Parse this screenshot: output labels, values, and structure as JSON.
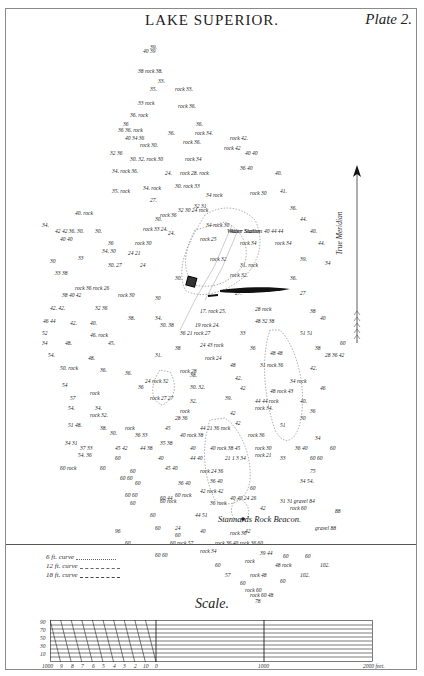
{
  "header": {
    "title": "LAKE SUPERIOR.",
    "plate": "Plate 2."
  },
  "compass": {
    "label": "True Meridian"
  },
  "map_labels": {
    "water_station": "Water Station",
    "beacon": "Stannards Rock Beacon.",
    "gravel_1": "gravel",
    "gravel_2": "gravel"
  },
  "soundings": [
    {
      "x": 150,
      "y": 44,
      "t": "39."
    },
    {
      "x": 143,
      "y": 48,
      "t": "40 39"
    },
    {
      "x": 138,
      "y": 68,
      "t": "38 rock 38."
    },
    {
      "x": 158,
      "y": 78,
      "t": "33."
    },
    {
      "x": 150,
      "y": 86,
      "t": "35."
    },
    {
      "x": 175,
      "y": 86,
      "t": "rock 33."
    },
    {
      "x": 138,
      "y": 100,
      "t": "33 rock"
    },
    {
      "x": 178,
      "y": 103,
      "t": "rock 36."
    },
    {
      "x": 130,
      "y": 112,
      "t": "36. rock"
    },
    {
      "x": 196,
      "y": 121,
      "t": "36."
    },
    {
      "x": 123,
      "y": 121,
      "t": "36"
    },
    {
      "x": 118,
      "y": 127,
      "t": "36 36. rock"
    },
    {
      "x": 168,
      "y": 130,
      "t": "36."
    },
    {
      "x": 195,
      "y": 130,
      "t": "rock 34."
    },
    {
      "x": 125,
      "y": 135,
      "t": "40 34 36"
    },
    {
      "x": 140,
      "y": 142,
      "t": "rock 30."
    },
    {
      "x": 183,
      "y": 139,
      "t": "rock 36."
    },
    {
      "x": 230,
      "y": 135,
      "t": "rock 42."
    },
    {
      "x": 224,
      "y": 145,
      "t": "rock 42"
    },
    {
      "x": 110,
      "y": 150,
      "t": "32 36"
    },
    {
      "x": 130,
      "y": 156,
      "t": "30. 32. rock 30"
    },
    {
      "x": 185,
      "y": 156,
      "t": "rock 34"
    },
    {
      "x": 245,
      "y": 150,
      "t": "40 40"
    },
    {
      "x": 112,
      "y": 168,
      "t": "34. rock 36."
    },
    {
      "x": 165,
      "y": 170,
      "t": "24."
    },
    {
      "x": 180,
      "y": 170,
      "t": "rock 28. rock"
    },
    {
      "x": 240,
      "y": 165,
      "t": "36 40"
    },
    {
      "x": 275,
      "y": 170,
      "t": "40."
    },
    {
      "x": 112,
      "y": 188,
      "t": "35. rock"
    },
    {
      "x": 143,
      "y": 185,
      "t": "34. rock"
    },
    {
      "x": 175,
      "y": 183,
      "t": "30. rock 33"
    },
    {
      "x": 206,
      "y": 192,
      "t": "34 rock"
    },
    {
      "x": 150,
      "y": 197,
      "t": "27."
    },
    {
      "x": 194,
      "y": 203,
      "t": "32 31"
    },
    {
      "x": 250,
      "y": 190,
      "t": "rock 30"
    },
    {
      "x": 280,
      "y": 188,
      "t": "41."
    },
    {
      "x": 75,
      "y": 210,
      "t": "40. rock"
    },
    {
      "x": 160,
      "y": 212,
      "t": "rock 36"
    },
    {
      "x": 155,
      "y": 216,
      "t": "30."
    },
    {
      "x": 290,
      "y": 205,
      "t": "36."
    },
    {
      "x": 300,
      "y": 216,
      "t": "44."
    },
    {
      "x": 178,
      "y": 207,
      "t": "32 30 24 rock"
    },
    {
      "x": 42,
      "y": 222,
      "t": "34."
    },
    {
      "x": 55,
      "y": 228,
      "t": "42 42 36. 30."
    },
    {
      "x": 95,
      "y": 228,
      "t": "30."
    },
    {
      "x": 143,
      "y": 226,
      "t": "rock 33 24."
    },
    {
      "x": 168,
      "y": 230,
      "t": "24."
    },
    {
      "x": 60,
      "y": 236,
      "t": "40 40"
    },
    {
      "x": 206,
      "y": 222,
      "t": "34 rock 30"
    },
    {
      "x": 230,
      "y": 228,
      "t": "Water Station"
    },
    {
      "x": 264,
      "y": 228,
      "t": "40 44 44"
    },
    {
      "x": 310,
      "y": 228,
      "t": "40."
    },
    {
      "x": 108,
      "y": 240,
      "t": "36"
    },
    {
      "x": 135,
      "y": 240,
      "t": "rock 30"
    },
    {
      "x": 200,
      "y": 236,
      "t": "rock 25"
    },
    {
      "x": 240,
      "y": 240,
      "t": "rock 34"
    },
    {
      "x": 275,
      "y": 240,
      "t": "rock 34"
    },
    {
      "x": 318,
      "y": 240,
      "t": "44."
    },
    {
      "x": 102,
      "y": 248,
      "t": "34. 30"
    },
    {
      "x": 128,
      "y": 250,
      "t": "24 21"
    },
    {
      "x": 50,
      "y": 258,
      "t": "30"
    },
    {
      "x": 78,
      "y": 255,
      "t": "33"
    },
    {
      "x": 108,
      "y": 262,
      "t": "30. 27"
    },
    {
      "x": 140,
      "y": 262,
      "t": "24"
    },
    {
      "x": 210,
      "y": 256,
      "t": "rock 32"
    },
    {
      "x": 240,
      "y": 262,
      "t": "31. rock"
    },
    {
      "x": 300,
      "y": 256,
      "t": "39."
    },
    {
      "x": 325,
      "y": 260,
      "t": "34"
    },
    {
      "x": 55,
      "y": 270,
      "t": "33 38"
    },
    {
      "x": 175,
      "y": 275,
      "t": "30."
    },
    {
      "x": 230,
      "y": 272,
      "t": "rock 32."
    },
    {
      "x": 290,
      "y": 275,
      "t": "36."
    },
    {
      "x": 75,
      "y": 285,
      "t": "rock 36 rock 26"
    },
    {
      "x": 62,
      "y": 292,
      "t": "38 40 42"
    },
    {
      "x": 118,
      "y": 292,
      "t": "rock 30"
    },
    {
      "x": 155,
      "y": 295,
      "t": "30"
    },
    {
      "x": 235,
      "y": 290,
      "t": "27."
    },
    {
      "x": 300,
      "y": 290,
      "t": "27"
    },
    {
      "x": 50,
      "y": 305,
      "t": "42. 42."
    },
    {
      "x": 95,
      "y": 305,
      "t": "32 36"
    },
    {
      "x": 128,
      "y": 315,
      "t": "38."
    },
    {
      "x": 155,
      "y": 315,
      "t": "34."
    },
    {
      "x": 200,
      "y": 308,
      "t": "17. rock 25."
    },
    {
      "x": 255,
      "y": 306,
      "t": "28 rock"
    },
    {
      "x": 310,
      "y": 308,
      "t": "38"
    },
    {
      "x": 43,
      "y": 318,
      "t": "46 44"
    },
    {
      "x": 70,
      "y": 320,
      "t": "42."
    },
    {
      "x": 90,
      "y": 320,
      "t": "40."
    },
    {
      "x": 160,
      "y": 322,
      "t": "30. 38"
    },
    {
      "x": 195,
      "y": 322,
      "t": "19 rock 24."
    },
    {
      "x": 255,
      "y": 318,
      "t": "48 32 38"
    },
    {
      "x": 320,
      "y": 315,
      "t": "40"
    },
    {
      "x": 42,
      "y": 330,
      "t": "52"
    },
    {
      "x": 90,
      "y": 332,
      "t": "46. rock"
    },
    {
      "x": 180,
      "y": 330,
      "t": "36 21 rock 27"
    },
    {
      "x": 240,
      "y": 330,
      "t": "33"
    },
    {
      "x": 300,
      "y": 330,
      "t": "51 51"
    },
    {
      "x": 340,
      "y": 340,
      "t": "60"
    },
    {
      "x": 42,
      "y": 340,
      "t": "34"
    },
    {
      "x": 65,
      "y": 340,
      "t": "48."
    },
    {
      "x": 108,
      "y": 340,
      "t": "45."
    },
    {
      "x": 175,
      "y": 345,
      "t": "38"
    },
    {
      "x": 200,
      "y": 342,
      "t": "24 43 rock"
    },
    {
      "x": 250,
      "y": 345,
      "t": "36"
    },
    {
      "x": 315,
      "y": 345,
      "t": "38"
    },
    {
      "x": 48,
      "y": 352,
      "t": "54."
    },
    {
      "x": 88,
      "y": 355,
      "t": "48."
    },
    {
      "x": 155,
      "y": 352,
      "t": "31."
    },
    {
      "x": 205,
      "y": 355,
      "t": "rock 24"
    },
    {
      "x": 270,
      "y": 350,
      "t": "48 48"
    },
    {
      "x": 325,
      "y": 352,
      "t": "28 36 42"
    },
    {
      "x": 60,
      "y": 365,
      "t": "50. rock"
    },
    {
      "x": 100,
      "y": 367,
      "t": "36."
    },
    {
      "x": 125,
      "y": 370,
      "t": "36."
    },
    {
      "x": 180,
      "y": 368,
      "t": "rock 28"
    },
    {
      "x": 230,
      "y": 362,
      "t": "48"
    },
    {
      "x": 260,
      "y": 362,
      "t": "31 rock 36"
    },
    {
      "x": 310,
      "y": 365,
      "t": "42."
    },
    {
      "x": 145,
      "y": 378,
      "t": "24 rock 32"
    },
    {
      "x": 190,
      "y": 372,
      "t": "38."
    },
    {
      "x": 235,
      "y": 375,
      "t": "42."
    },
    {
      "x": 290,
      "y": 378,
      "t": "34 rock"
    },
    {
      "x": 62,
      "y": 382,
      "t": "54"
    },
    {
      "x": 90,
      "y": 390,
      "t": "rock"
    },
    {
      "x": 138,
      "y": 384,
      "t": "36"
    },
    {
      "x": 190,
      "y": 384,
      "t": "30. 32."
    },
    {
      "x": 240,
      "y": 385,
      "t": "42"
    },
    {
      "x": 270,
      "y": 388,
      "t": "48 rock 43"
    },
    {
      "x": 320,
      "y": 385,
      "t": "46"
    },
    {
      "x": 70,
      "y": 395,
      "t": "57"
    },
    {
      "x": 150,
      "y": 395,
      "t": "rock 27 27"
    },
    {
      "x": 190,
      "y": 398,
      "t": "32."
    },
    {
      "x": 225,
      "y": 395,
      "t": "39."
    },
    {
      "x": 255,
      "y": 398,
      "t": "44 44 rock"
    },
    {
      "x": 300,
      "y": 398,
      "t": "40."
    },
    {
      "x": 68,
      "y": 405,
      "t": "54."
    },
    {
      "x": 95,
      "y": 405,
      "t": "34."
    },
    {
      "x": 180,
      "y": 408,
      "t": "rock"
    },
    {
      "x": 230,
      "y": 410,
      "t": "42"
    },
    {
      "x": 255,
      "y": 405,
      "t": "rock 34."
    },
    {
      "x": 310,
      "y": 408,
      "t": "36"
    },
    {
      "x": 90,
      "y": 412,
      "t": "rock 32."
    },
    {
      "x": 175,
      "y": 415,
      "t": "28 36"
    },
    {
      "x": 235,
      "y": 420,
      "t": "42"
    },
    {
      "x": 300,
      "y": 415,
      "t": "30"
    },
    {
      "x": 68,
      "y": 422,
      "t": "51 48."
    },
    {
      "x": 100,
      "y": 425,
      "t": "38."
    },
    {
      "x": 125,
      "y": 425,
      "t": "rock"
    },
    {
      "x": 165,
      "y": 425,
      "t": "45"
    },
    {
      "x": 200,
      "y": 425,
      "t": "44 21 36 rock"
    },
    {
      "x": 280,
      "y": 422,
      "t": "51"
    },
    {
      "x": 110,
      "y": 430,
      "t": "30."
    },
    {
      "x": 135,
      "y": 432,
      "t": "36 33"
    },
    {
      "x": 180,
      "y": 432,
      "t": "40 rock 38"
    },
    {
      "x": 248,
      "y": 432,
      "t": "rock 36"
    },
    {
      "x": 315,
      "y": 435,
      "t": "34"
    },
    {
      "x": 65,
      "y": 440,
      "t": "34 31"
    },
    {
      "x": 80,
      "y": 445,
      "t": "37 33"
    },
    {
      "x": 115,
      "y": 445,
      "t": "45 42"
    },
    {
      "x": 140,
      "y": 445,
      "t": "44 38"
    },
    {
      "x": 160,
      "y": 440,
      "t": "35 38"
    },
    {
      "x": 190,
      "y": 445,
      "t": "40"
    },
    {
      "x": 210,
      "y": 445,
      "t": "40 rock 38 45"
    },
    {
      "x": 255,
      "y": 445,
      "t": "rock 30"
    },
    {
      "x": 295,
      "y": 445,
      "t": "36 40"
    },
    {
      "x": 330,
      "y": 445,
      "t": "60"
    },
    {
      "x": 78,
      "y": 452,
      "t": "54. 36"
    },
    {
      "x": 115,
      "y": 455,
      "t": "60"
    },
    {
      "x": 158,
      "y": 455,
      "t": "40"
    },
    {
      "x": 190,
      "y": 455,
      "t": "44 40"
    },
    {
      "x": 225,
      "y": 455,
      "t": "21 1 3 34"
    },
    {
      "x": 255,
      "y": 452,
      "t": "rock 21"
    },
    {
      "x": 280,
      "y": 455,
      "t": "33"
    },
    {
      "x": 310,
      "y": 455,
      "t": "60 60"
    },
    {
      "x": 60,
      "y": 465,
      "t": "60 rock"
    },
    {
      "x": 100,
      "y": 465,
      "t": "60"
    },
    {
      "x": 130,
      "y": 468,
      "t": "60"
    },
    {
      "x": 165,
      "y": 465,
      "t": "45 40"
    },
    {
      "x": 200,
      "y": 468,
      "t": "rock 24 36"
    },
    {
      "x": 310,
      "y": 468,
      "t": "75"
    },
    {
      "x": 120,
      "y": 475,
      "t": "60 60"
    },
    {
      "x": 135,
      "y": 480,
      "t": "60"
    },
    {
      "x": 178,
      "y": 480,
      "t": "36 40"
    },
    {
      "x": 210,
      "y": 478,
      "t": "36 40"
    },
    {
      "x": 300,
      "y": 478,
      "t": "34 54."
    },
    {
      "x": 200,
      "y": 488,
      "t": "42 rock 42"
    },
    {
      "x": 250,
      "y": 485,
      "t": "60"
    },
    {
      "x": 125,
      "y": 492,
      "t": "60 60"
    },
    {
      "x": 160,
      "y": 495,
      "t": "60 44"
    },
    {
      "x": 175,
      "y": 492,
      "t": "60 rock"
    },
    {
      "x": 230,
      "y": 495,
      "t": "40 40 24 26"
    },
    {
      "x": 160,
      "y": 498,
      "t": "60 rock"
    },
    {
      "x": 280,
      "y": 498,
      "t": "31 31 gravel 84"
    },
    {
      "x": 130,
      "y": 500,
      "t": "60"
    },
    {
      "x": 210,
      "y": 500,
      "t": "36 rock"
    },
    {
      "x": 260,
      "y": 505,
      "t": "42"
    },
    {
      "x": 290,
      "y": 505,
      "t": "rock 60"
    },
    {
      "x": 335,
      "y": 508,
      "t": "88"
    },
    {
      "x": 150,
      "y": 512,
      "t": "60"
    },
    {
      "x": 195,
      "y": 512,
      "t": "44 51"
    },
    {
      "x": 155,
      "y": 525,
      "t": "60"
    },
    {
      "x": 175,
      "y": 525,
      "t": "24"
    },
    {
      "x": 200,
      "y": 528,
      "t": "40"
    },
    {
      "x": 245,
      "y": 528,
      "t": "42"
    },
    {
      "x": 175,
      "y": 532,
      "t": "60"
    },
    {
      "x": 230,
      "y": 530,
      "t": "rock 36"
    },
    {
      "x": 315,
      "y": 525,
      "t": "gravel 88"
    },
    {
      "x": 115,
      "y": 528,
      "t": "96"
    },
    {
      "x": 125,
      "y": 540,
      "t": "60"
    },
    {
      "x": 170,
      "y": 540,
      "t": "60 rock 57"
    },
    {
      "x": 215,
      "y": 540,
      "t": "rock 36 40 rock 36 60"
    },
    {
      "x": 200,
      "y": 548,
      "t": "rock 34"
    },
    {
      "x": 155,
      "y": 552,
      "t": "60 60"
    },
    {
      "x": 260,
      "y": 550,
      "t": "39 44"
    },
    {
      "x": 283,
      "y": 553,
      "t": "60"
    },
    {
      "x": 305,
      "y": 553,
      "t": "60"
    },
    {
      "x": 245,
      "y": 558,
      "t": "rock"
    },
    {
      "x": 215,
      "y": 562,
      "t": "60"
    },
    {
      "x": 275,
      "y": 562,
      "t": "48 rock"
    },
    {
      "x": 320,
      "y": 562,
      "t": "102."
    },
    {
      "x": 225,
      "y": 572,
      "t": "57"
    },
    {
      "x": 250,
      "y": 572,
      "t": "rock 48"
    },
    {
      "x": 300,
      "y": 572,
      "t": "102."
    },
    {
      "x": 280,
      "y": 578,
      "t": "60"
    },
    {
      "x": 240,
      "y": 580,
      "t": "60"
    },
    {
      "x": 245,
      "y": 587,
      "t": "rock 60"
    },
    {
      "x": 250,
      "y": 592,
      "t": "rock 60 48"
    },
    {
      "x": 255,
      "y": 598,
      "t": "78"
    }
  ],
  "legend": {
    "items": [
      {
        "label": "6 ft. curve",
        "style": "dotted"
      },
      {
        "label": "12 ft. curve",
        "style": "dashed"
      },
      {
        "label": "18 ft. curve",
        "style": "dash-dot"
      }
    ]
  },
  "scale": {
    "title": "Scale.",
    "left_ticks": [
      "1000",
      "9",
      "8",
      "7",
      "6",
      "5",
      "4",
      "3",
      "2",
      "10",
      "0"
    ],
    "mid_tick": "1000",
    "end_tick": "2000 feet.",
    "row_labels": [
      "90",
      "70",
      "50",
      "30",
      "10"
    ]
  }
}
